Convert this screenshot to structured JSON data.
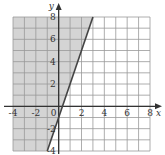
{
  "chart_data": {
    "type": "line",
    "title": "",
    "xlabel": "x",
    "ylabel": "y",
    "xlim": [
      -4,
      8
    ],
    "ylim": [
      -4,
      8
    ],
    "grid": true,
    "grid_step": 1,
    "x_ticks": [
      -4,
      -2,
      0,
      2,
      4,
      6,
      8
    ],
    "y_ticks": [
      -4,
      -2,
      2,
      4,
      6,
      8
    ],
    "x_tick_labels": [
      "-4",
      "-2",
      "0",
      "2",
      "4",
      "6",
      "8"
    ],
    "y_tick_labels": [
      "-4",
      "-2",
      "2",
      "4",
      "6",
      "8"
    ],
    "series": [
      {
        "name": "boundary line",
        "equation": "y = 3x - 1",
        "style": "solid",
        "x": [
          -1,
          3
        ],
        "y": [
          -4,
          8
        ]
      }
    ],
    "inequality": "y >= 3x - 1",
    "shaded_region": "left of / above the line",
    "shade_color": "#d4d4d4",
    "line_color": "#444444",
    "grid_color": "#999999"
  }
}
